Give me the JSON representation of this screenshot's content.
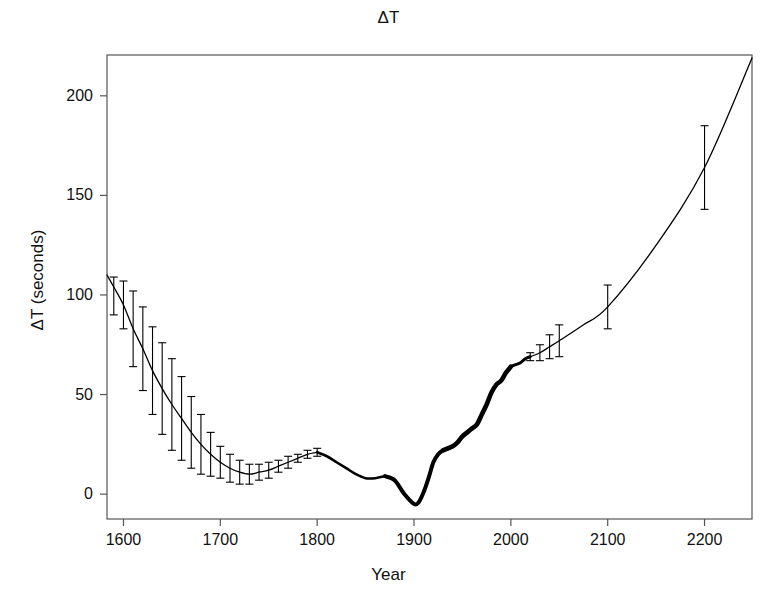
{
  "chart_data": {
    "type": "line",
    "title": "ΔT",
    "xlabel": "Year",
    "ylabel": "ΔT (seconds)",
    "xlim": [
      1583,
      1249
    ],
    "x_axis_range": [
      1583,
      2249
    ],
    "ylim": [
      -12,
      220
    ],
    "grid": false,
    "legend": "none",
    "xticks": [
      1600,
      1700,
      1800,
      1900,
      2000,
      2100,
      2200
    ],
    "xtick_labels": [
      "1600",
      "1700",
      "1800",
      "1900",
      "2000",
      "2100",
      "2200"
    ],
    "yticks": [
      0,
      50,
      100,
      150,
      200
    ],
    "ytick_labels": [
      "0",
      "50",
      "100",
      "150",
      "200"
    ],
    "series": [
      {
        "name": "ΔT curve",
        "style": "solid black line, thickness grows with data density",
        "x": [
          1583,
          1590,
          1600,
          1610,
          1620,
          1630,
          1640,
          1650,
          1660,
          1670,
          1680,
          1690,
          1700,
          1710,
          1720,
          1730,
          1740,
          1750,
          1760,
          1770,
          1780,
          1790,
          1800,
          1810,
          1820,
          1830,
          1840,
          1850,
          1860,
          1870,
          1880,
          1890,
          1900,
          1905,
          1910,
          1915,
          1920,
          1925,
          1930,
          1935,
          1940,
          1945,
          1950,
          1955,
          1960,
          1965,
          1970,
          1975,
          1980,
          1985,
          1990,
          1995,
          2000,
          2005,
          2010,
          2015,
          2020,
          2030,
          2040,
          2050,
          2075,
          2100,
          2150,
          2200,
          2249
        ],
        "y": [
          110,
          104,
          95,
          83,
          73,
          62,
          53,
          45,
          38,
          31,
          25,
          20,
          16,
          13,
          11,
          10,
          11,
          12,
          14,
          16,
          18,
          20,
          21,
          19,
          16,
          13,
          10,
          8,
          8,
          9,
          7,
          0,
          -5,
          -4,
          1,
          8,
          16,
          20,
          22,
          23,
          24,
          26,
          29,
          31,
          33,
          35,
          40,
          45,
          51,
          55,
          57,
          61,
          64,
          65,
          66,
          68,
          69,
          71,
          74,
          77,
          85,
          94,
          125,
          164,
          219
        ]
      }
    ],
    "error_bars": [
      {
        "x": 1590,
        "y": 104,
        "yerr_low": 14,
        "yerr_high": 5
      },
      {
        "x": 1600,
        "y": 95,
        "yerr_low": 12,
        "yerr_high": 12
      },
      {
        "x": 1610,
        "y": 83,
        "yerr_low": 19,
        "yerr_high": 19
      },
      {
        "x": 1620,
        "y": 73,
        "yerr_low": 21,
        "yerr_high": 21
      },
      {
        "x": 1630,
        "y": 62,
        "yerr_low": 22,
        "yerr_high": 22
      },
      {
        "x": 1640,
        "y": 53,
        "yerr_low": 23,
        "yerr_high": 23
      },
      {
        "x": 1650,
        "y": 45,
        "yerr_low": 23,
        "yerr_high": 23
      },
      {
        "x": 1660,
        "y": 38,
        "yerr_low": 21,
        "yerr_high": 21
      },
      {
        "x": 1670,
        "y": 31,
        "yerr_low": 18,
        "yerr_high": 18
      },
      {
        "x": 1680,
        "y": 25,
        "yerr_low": 15,
        "yerr_high": 15
      },
      {
        "x": 1690,
        "y": 20,
        "yerr_low": 11,
        "yerr_high": 11
      },
      {
        "x": 1700,
        "y": 16,
        "yerr_low": 8,
        "yerr_high": 8
      },
      {
        "x": 1710,
        "y": 13,
        "yerr_low": 7,
        "yerr_high": 7
      },
      {
        "x": 1720,
        "y": 11,
        "yerr_low": 6,
        "yerr_high": 6
      },
      {
        "x": 1730,
        "y": 10,
        "yerr_low": 5,
        "yerr_high": 5
      },
      {
        "x": 1740,
        "y": 11,
        "yerr_low": 4,
        "yerr_high": 4
      },
      {
        "x": 1750,
        "y": 12,
        "yerr_low": 4,
        "yerr_high": 4
      },
      {
        "x": 1760,
        "y": 14,
        "yerr_low": 3,
        "yerr_high": 3
      },
      {
        "x": 1770,
        "y": 16,
        "yerr_low": 3,
        "yerr_high": 3
      },
      {
        "x": 1780,
        "y": 18,
        "yerr_low": 2,
        "yerr_high": 2
      },
      {
        "x": 1790,
        "y": 20,
        "yerr_low": 2,
        "yerr_high": 2
      },
      {
        "x": 1800,
        "y": 21,
        "yerr_low": 2,
        "yerr_high": 2
      },
      {
        "x": 2020,
        "y": 69,
        "yerr_low": 2,
        "yerr_high": 2
      },
      {
        "x": 2030,
        "y": 71,
        "yerr_low": 4,
        "yerr_high": 4
      },
      {
        "x": 2040,
        "y": 74,
        "yerr_low": 6,
        "yerr_high": 6
      },
      {
        "x": 2050,
        "y": 77,
        "yerr_low": 8,
        "yerr_high": 8
      },
      {
        "x": 2100,
        "y": 94,
        "yerr_low": 11,
        "yerr_high": 11
      },
      {
        "x": 2200,
        "y": 164,
        "yerr_low": 21,
        "yerr_high": 21
      }
    ]
  },
  "colors": {
    "line": "#000000",
    "axis": "#555555",
    "text": "#111111",
    "background": "#ffffff"
  }
}
